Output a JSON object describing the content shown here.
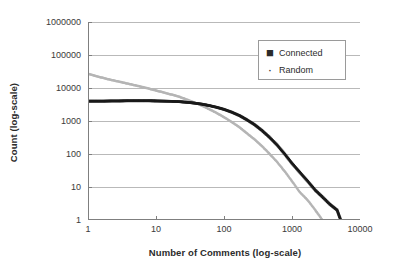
{
  "chart_data": {
    "type": "scatter",
    "title": "",
    "xlabel": "Number of Comments (log-scale)",
    "ylabel": "Count (log-scale)",
    "xscale": "log",
    "yscale": "log",
    "xlim": [
      1,
      10000
    ],
    "ylim": [
      1,
      1000000
    ],
    "grid": true,
    "grid_axis": "y",
    "legend_position": "top-right-inside",
    "xticks": [
      "1",
      "10",
      "100",
      "1000",
      "10000"
    ],
    "xtick_values": [
      1,
      10,
      100,
      1000,
      10000
    ],
    "yticks": [
      "1",
      "10",
      "100",
      "1000",
      "10000",
      "100000",
      "1000000"
    ],
    "ytick_values": [
      1,
      10,
      100,
      1000,
      10000,
      100000,
      1000000
    ],
    "series": [
      {
        "name": "Connected",
        "color": "#1a1a1a",
        "marker": "square",
        "points": [
          [
            1,
            4000
          ],
          [
            1.3,
            4000
          ],
          [
            1.7,
            4000
          ],
          [
            2.2,
            4050
          ],
          [
            2.9,
            4050
          ],
          [
            3.7,
            4100
          ],
          [
            4.8,
            4100
          ],
          [
            6.2,
            4100
          ],
          [
            8,
            4100
          ],
          [
            10,
            4050
          ],
          [
            13,
            4000
          ],
          [
            17,
            3950
          ],
          [
            22,
            3850
          ],
          [
            28,
            3700
          ],
          [
            36,
            3500
          ],
          [
            47,
            3250
          ],
          [
            60,
            2950
          ],
          [
            78,
            2600
          ],
          [
            100,
            2250
          ],
          [
            130,
            1850
          ],
          [
            170,
            1450
          ],
          [
            215,
            1100
          ],
          [
            280,
            780
          ],
          [
            360,
            520
          ],
          [
            460,
            330
          ],
          [
            600,
            190
          ],
          [
            780,
            100
          ],
          [
            1000,
            52
          ],
          [
            1300,
            28
          ],
          [
            1700,
            15
          ],
          [
            2200,
            8
          ],
          [
            2800,
            5
          ],
          [
            3600,
            3
          ],
          [
            4600,
            2
          ],
          [
            5200,
            1
          ]
        ]
      },
      {
        "name": "Random",
        "color": "#b5b5b5",
        "marker": "dot",
        "points": [
          [
            1,
            27000
          ],
          [
            1.3,
            23000
          ],
          [
            1.7,
            20000
          ],
          [
            2.2,
            17500
          ],
          [
            2.9,
            15500
          ],
          [
            3.7,
            13800
          ],
          [
            4.8,
            12200
          ],
          [
            6.2,
            10800
          ],
          [
            8,
            9500
          ],
          [
            10,
            8400
          ],
          [
            13,
            7300
          ],
          [
            17,
            6300
          ],
          [
            22,
            5400
          ],
          [
            28,
            4500
          ],
          [
            36,
            3700
          ],
          [
            47,
            2950
          ],
          [
            60,
            2300
          ],
          [
            78,
            1750
          ],
          [
            100,
            1300
          ],
          [
            130,
            930
          ],
          [
            170,
            640
          ],
          [
            215,
            430
          ],
          [
            280,
            280
          ],
          [
            360,
            175
          ],
          [
            460,
            105
          ],
          [
            600,
            58
          ],
          [
            780,
            30
          ],
          [
            1000,
            15
          ],
          [
            1300,
            7
          ],
          [
            1700,
            4
          ],
          [
            2200,
            2
          ],
          [
            2800,
            1
          ]
        ]
      }
    ]
  },
  "legend": {
    "items": [
      {
        "label": "Connected",
        "marker": "■"
      },
      {
        "label": "Random",
        "marker": "·"
      }
    ]
  }
}
